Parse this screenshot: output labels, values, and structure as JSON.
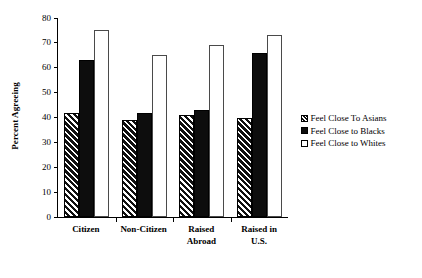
{
  "chart_data": {
    "type": "bar",
    "title": "",
    "xlabel": "",
    "ylabel": "Percent Agreeing",
    "ylim": [
      0,
      80
    ],
    "yticks": [
      0,
      10,
      20,
      30,
      40,
      50,
      60,
      70,
      80
    ],
    "grid": false,
    "legend_position": "right",
    "categories": [
      "Citizen",
      "Non-Citizen",
      "Raised\nAbroad",
      "Raised in\nU.S."
    ],
    "series": [
      {
        "name": "Feel Close To Asians",
        "swatch": "hatched-diagonal",
        "values": [
          42,
          39,
          41,
          40
        ]
      },
      {
        "name": "Feel Close to Blacks",
        "swatch": "solid-black",
        "values": [
          63,
          42,
          43,
          66
        ]
      },
      {
        "name": "Feel Close to Whites",
        "swatch": "open-white",
        "values": [
          75,
          65,
          69,
          73
        ]
      }
    ]
  },
  "colors": {
    "axis": "#000000",
    "series_hatched": "#101010",
    "series_solid": "#0d0d0d",
    "series_open": "#ffffff",
    "background": "#ffffff"
  }
}
